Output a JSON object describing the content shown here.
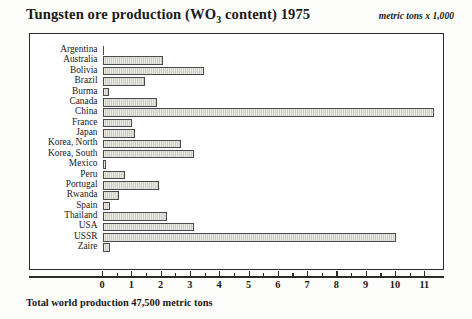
{
  "header": {
    "title_prefix": "Tungsten ore production (WO",
    "title_subscript": "3",
    "title_suffix": " content) 1975",
    "unit_note": "metric tons x 1,000"
  },
  "footer": {
    "note": "Total world production 47,500 metric tons"
  },
  "colors": {
    "bar_fill": "#cdcdc6",
    "bar_stroke": "#4a4a4a",
    "frame": "#2b2b2b",
    "background": "#fdfdfb",
    "text": "#1a1a1a"
  },
  "chart_data": {
    "type": "bar",
    "orientation": "horizontal",
    "title": "Tungsten ore production (WO3 content) 1975",
    "subtitle": "metric tons x 1,000",
    "xlabel": "",
    "ylabel": "",
    "xlim": [
      0,
      11.7
    ],
    "grid": false,
    "legend": null,
    "annotations": [
      "Total world production 47,500 metric tons"
    ],
    "xticks": [
      0,
      1,
      2,
      3,
      4,
      5,
      6,
      7,
      8,
      9,
      10,
      11
    ],
    "xtick_labels": [
      "0",
      "1",
      "2",
      "3",
      "4",
      "5",
      "6",
      "7",
      "8",
      "9",
      "10",
      "11"
    ],
    "minor_xticks": [
      0.5,
      1.5,
      2.5,
      3.5,
      4.5,
      5.5,
      6.5,
      7.5,
      8.5,
      9.5,
      10.5
    ],
    "categories": [
      "Argentina",
      "Australia",
      "Bolivia",
      "Brazil",
      "Burma",
      "Canada",
      "China",
      "France",
      "Japan",
      "Korea, North",
      "Korea, South",
      "Mexico",
      "Peru",
      "Portugal",
      "Rwanda",
      "Spain",
      "Thailand",
      "USA",
      "USSR",
      "Zaire"
    ],
    "values": [
      0.05,
      2.05,
      3.45,
      1.45,
      0.2,
      1.85,
      11.3,
      1.0,
      1.1,
      2.65,
      3.1,
      0.1,
      0.75,
      1.9,
      0.55,
      0.25,
      2.2,
      3.1,
      10.0,
      0.25
    ]
  }
}
